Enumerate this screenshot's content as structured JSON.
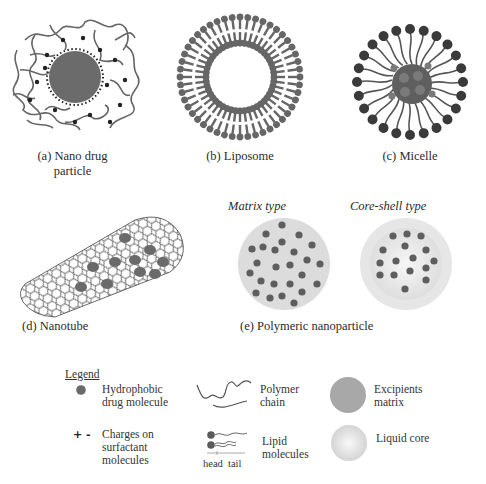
{
  "figure": {
    "panels": [
      {
        "id": "a",
        "caption_line1": "(a) Nano drug",
        "caption_line2": "particle"
      },
      {
        "id": "b",
        "caption": "(b) Liposome"
      },
      {
        "id": "c",
        "caption": "(c) Micelle"
      },
      {
        "id": "d",
        "caption": "(d) Nanotube"
      },
      {
        "id": "e",
        "caption": "(e) Polymeric nanoparticle",
        "subtypes": [
          {
            "label": "Matrix type"
          },
          {
            "label": "Core-shell type"
          }
        ]
      }
    ],
    "legend": {
      "title": "Legend",
      "items": [
        {
          "icon": "hydrophobic-drug-dot-icon",
          "line1": "Hydrophobic",
          "line2": "drug molecule"
        },
        {
          "icon": "charges-icon",
          "line1": "Charges on",
          "line2": "surfactant",
          "line3": "molecules",
          "glyph": "+ -"
        },
        {
          "icon": "polymer-chain-icon",
          "line1": "Polymer",
          "line2": "chain"
        },
        {
          "icon": "lipid-molecule-icon",
          "line1": "Lipid",
          "line2": "molecules",
          "head_label": "head",
          "tail_label": "tail"
        },
        {
          "icon": "excipients-matrix-icon",
          "line1": "Excipients",
          "line2": "matrix"
        },
        {
          "icon": "liquid-core-icon",
          "line1": "Liquid core"
        }
      ]
    },
    "colors": {
      "dark_gray": "#5e5e5e",
      "drug_dot": "#606060",
      "matrix_fill": "#d9d9d9",
      "shell_fill": "#e4e4e4",
      "core_fill": "#f0f0f0",
      "line": "#555555"
    }
  }
}
